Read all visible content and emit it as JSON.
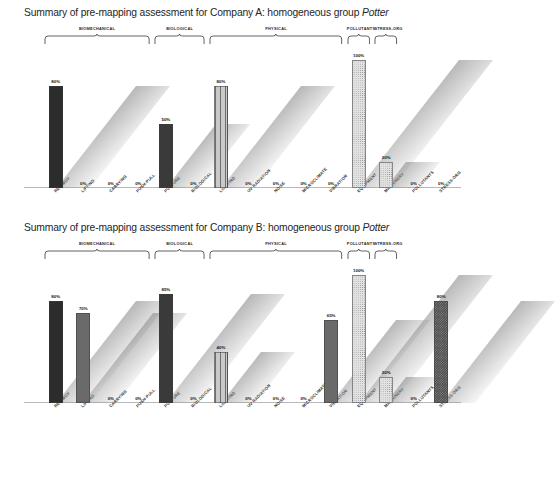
{
  "charts": [
    {
      "title_prefix": "Summary of pre-mapping assessment for Company A: homogeneous group ",
      "group_name": "Potter",
      "company": "Company A"
    },
    {
      "title_prefix": "Summary of pre-mapping assessment for Company B: homogeneous group ",
      "group_name": "Potter",
      "company": "Company B"
    }
  ],
  "categories": [
    {
      "label": "BIOMECHANICAL",
      "span": 4
    },
    {
      "label": "BIOLOGICAL",
      "span": 2
    },
    {
      "label": "PHYSICAL",
      "span": 5
    },
    {
      "label": "POLLUTANTS",
      "span": 1
    },
    {
      "label": "STRESS-ORG",
      "span": 1
    }
  ],
  "chart_data": [
    {
      "type": "bar",
      "title": "Summary of pre-mapping assessment for Company A: homogeneous group Potter",
      "xlabel": "",
      "ylabel": "",
      "ylim": [
        0,
        100
      ],
      "grid": false,
      "legend": "none",
      "categories": [
        "REP-MOV",
        "LIFTING",
        "CARRYING",
        "PUSH-PULL",
        "POSTURE",
        "BIOLOGICAL",
        "LIGHTING",
        "UV RADIATION",
        "NOISE",
        "MICROCLIMATE",
        "VIBRATION",
        "EQUIPMENT",
        "MACHINERY",
        "POLLUTANTS",
        "STRESS-ORG"
      ],
      "values": [
        80,
        0,
        0,
        0,
        50,
        0,
        80,
        0,
        0,
        0,
        0,
        100,
        20,
        0,
        0
      ],
      "value_labels": [
        "80%",
        "0%",
        "0%",
        "0%",
        "50%",
        "0%",
        "80%",
        "0%",
        "0%",
        "0%",
        "0%",
        "100%",
        "20%",
        "0%",
        "0%"
      ],
      "groups": [
        "BIOMECHANICAL",
        "BIOMECHANICAL",
        "BIOMECHANICAL",
        "BIOMECHANICAL",
        "BIOLOGICAL",
        "BIOLOGICAL",
        "PHYSICAL",
        "PHYSICAL",
        "PHYSICAL",
        "PHYSICAL",
        "PHYSICAL",
        "PHYSICAL",
        "PHYSICAL",
        "POLLUTANTS",
        "STRESS-ORG"
      ],
      "fills": [
        "fill-solid-dark",
        "fill-solid-dark",
        "fill-solid-dark",
        "fill-solid-dark",
        "fill-dots-dark",
        "fill-dots-dark",
        "fill-vlines",
        "fill-vlines",
        "fill-medium",
        "fill-medium",
        "fill-medium",
        "fill-dots-light",
        "fill-dots-light",
        "fill-medium",
        "fill-checker"
      ]
    },
    {
      "type": "bar",
      "title": "Summary of pre-mapping assessment for Company B: homogeneous group Potter",
      "xlabel": "",
      "ylabel": "",
      "ylim": [
        0,
        100
      ],
      "grid": false,
      "legend": "none",
      "categories": [
        "REP-MOV",
        "LIFTING",
        "CARRYING",
        "PUSH-PULL",
        "POSTURE",
        "BIOLOGICAL",
        "LIGHTING",
        "UV RADIATION",
        "NOISE",
        "MICROCLIMATE",
        "VIBRATION",
        "EQUIPMENT",
        "MACHINERY",
        "POLLUTANTS",
        "STRESS-ORG"
      ],
      "values": [
        80,
        70,
        0,
        0,
        85,
        0,
        40,
        0,
        0,
        0,
        65,
        100,
        20,
        0,
        80
      ],
      "value_labels": [
        "80%",
        "70%",
        "0%",
        "0%",
        "85%",
        "0%",
        "40%",
        "0%",
        "0%",
        "0%",
        "65%",
        "100%",
        "20%",
        "0%",
        "80%"
      ],
      "groups": [
        "BIOMECHANICAL",
        "BIOMECHANICAL",
        "BIOMECHANICAL",
        "BIOMECHANICAL",
        "BIOLOGICAL",
        "BIOLOGICAL",
        "PHYSICAL",
        "PHYSICAL",
        "PHYSICAL",
        "PHYSICAL",
        "PHYSICAL",
        "PHYSICAL",
        "PHYSICAL",
        "POLLUTANTS",
        "STRESS-ORG"
      ],
      "fills": [
        "fill-solid-dark",
        "fill-medium",
        "fill-solid-dark",
        "fill-solid-dark",
        "fill-dots-dark",
        "fill-dots-dark",
        "fill-vlines",
        "fill-vlines",
        "fill-medium",
        "fill-medium",
        "fill-medium",
        "fill-dots-light",
        "fill-dots-light",
        "fill-medium",
        "fill-checker"
      ]
    }
  ]
}
